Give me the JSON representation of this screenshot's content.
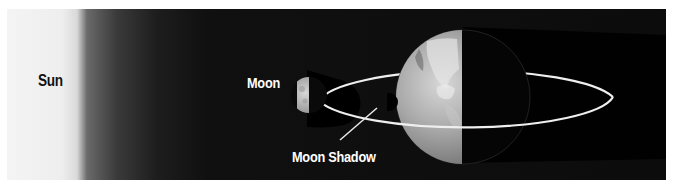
{
  "diagram": {
    "labels": {
      "sun": "Sun",
      "moon": "Moon",
      "moon_shadow": "Moon Shadow"
    },
    "elements": [
      {
        "id": "sun",
        "type": "glowing light source",
        "position": "left edge"
      },
      {
        "id": "moon",
        "type": "half-lit sphere",
        "position": "on orbit, left of Earth"
      },
      {
        "id": "moon-orbit",
        "type": "white ellipse around Earth"
      },
      {
        "id": "moon-shadow",
        "type": "dark shadow cast onto Earth"
      },
      {
        "id": "earth",
        "type": "half-lit sphere",
        "position": "right-center"
      },
      {
        "id": "earth-shadow",
        "type": "dark band extending right of Earth"
      }
    ],
    "colors": {
      "sun_glow": "#f2f2f2",
      "space": "#0c0c0c",
      "orbit": "#f0f0f0",
      "label_dark": "#111111",
      "label_light": "#ffffff"
    }
  }
}
